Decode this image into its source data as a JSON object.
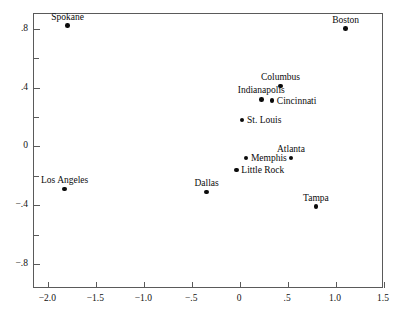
{
  "chart_data": {
    "type": "scatter",
    "title": "",
    "xlabel": "",
    "ylabel": "",
    "xlim": [
      -2.15,
      1.5
    ],
    "ylim": [
      -0.97,
      0.9
    ],
    "grid": false,
    "legend": "none",
    "x_ticks": [
      {
        "value": -2.0,
        "label": "−2.0",
        "kind": "major"
      },
      {
        "value": -1.5,
        "label": "−1.5",
        "kind": "major"
      },
      {
        "value": -1.0,
        "label": "−1.0",
        "kind": "major"
      },
      {
        "value": -0.5,
        "label": "−.5",
        "kind": "major"
      },
      {
        "value": 0.0,
        "label": "0",
        "kind": "major"
      },
      {
        "value": 0.5,
        "label": ".5",
        "kind": "major"
      },
      {
        "value": 1.0,
        "label": "1.0",
        "kind": "major"
      },
      {
        "value": 1.5,
        "label": "1.5",
        "kind": "major"
      }
    ],
    "y_ticks": [
      {
        "value": 0.8,
        "label": ".8",
        "kind": "major"
      },
      {
        "value": 0.6,
        "label": "",
        "kind": "minor"
      },
      {
        "value": 0.4,
        "label": ".4",
        "kind": "major"
      },
      {
        "value": 0.2,
        "label": "",
        "kind": "minor"
      },
      {
        "value": 0.0,
        "label": "0",
        "kind": "major"
      },
      {
        "value": -0.2,
        "label": "",
        "kind": "minor"
      },
      {
        "value": -0.4,
        "label": "−.4",
        "kind": "major"
      },
      {
        "value": -0.6,
        "label": "",
        "kind": "minor"
      },
      {
        "value": -0.8,
        "label": "−.8",
        "kind": "major"
      }
    ],
    "points": [
      {
        "label": "Spokane",
        "x": -1.8,
        "y": 0.82,
        "label_pos": "above"
      },
      {
        "label": "Boston",
        "x": 1.1,
        "y": 0.8,
        "label_pos": "above"
      },
      {
        "label": "Columbus",
        "x": 0.42,
        "y": 0.41,
        "label_pos": "above"
      },
      {
        "label": "Indianapolis",
        "x": 0.22,
        "y": 0.32,
        "label_pos": "above"
      },
      {
        "label": "Cincinnati",
        "x": 0.33,
        "y": 0.31,
        "label_pos": "right"
      },
      {
        "label": "St. Louis",
        "x": 0.02,
        "y": 0.18,
        "label_pos": "right"
      },
      {
        "label": "Atlanta",
        "x": 0.53,
        "y": -0.08,
        "label_pos": "above"
      },
      {
        "label": "Memphis",
        "x": 0.06,
        "y": -0.08,
        "label_pos": "right"
      },
      {
        "label": "Little Rock",
        "x": -0.04,
        "y": -0.16,
        "label_pos": "right"
      },
      {
        "label": "Los Angeles",
        "x": -1.83,
        "y": -0.29,
        "label_pos": "above"
      },
      {
        "label": "Dallas",
        "x": -0.35,
        "y": -0.31,
        "label_pos": "above"
      },
      {
        "label": "Tampa",
        "x": 0.79,
        "y": -0.41,
        "label_pos": "above"
      }
    ]
  },
  "colors": {
    "point": "#0b0b0b",
    "frame": "#5a5a5a",
    "text": "#111111",
    "background": "#ffffff"
  }
}
